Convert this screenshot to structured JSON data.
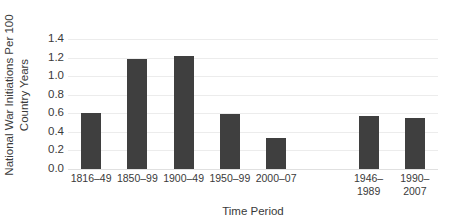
{
  "chart_data": {
    "type": "bar",
    "title": "",
    "xlabel": "Time Period",
    "ylabel": "National War Initiations Per 100 Country Years",
    "ylabel_line1": "National War Initiations Per 100",
    "ylabel_line2": "Country Years",
    "categories": [
      "1816–49",
      "1850–99",
      "1900–49",
      "1950–99",
      "2000–07",
      "",
      "1946–1989",
      "1990–2007"
    ],
    "values": [
      0.6,
      1.18,
      1.22,
      0.59,
      0.33,
      null,
      0.57,
      0.55
    ],
    "ylim": [
      0.0,
      1.4
    ],
    "ytick_labels": [
      "0.0",
      "0.2",
      "0.4",
      "0.6",
      "0.8",
      "1.0",
      "1.2",
      "1.4"
    ],
    "ytick_values": [
      0.0,
      0.2,
      0.4,
      0.6,
      0.8,
      1.0,
      1.2,
      1.4
    ],
    "grid": true,
    "legend": false,
    "bar_color": "#3f3f3f",
    "grid_color": "#ececec",
    "background_color": "#ffffff",
    "bars": [
      {
        "label_lines": [
          "1816–49"
        ],
        "value": 0.6,
        "slot": 0
      },
      {
        "label_lines": [
          "1850–99"
        ],
        "value": 1.18,
        "slot": 1
      },
      {
        "label_lines": [
          "1900–49"
        ],
        "value": 1.22,
        "slot": 2
      },
      {
        "label_lines": [
          "1950–99"
        ],
        "value": 0.59,
        "slot": 3
      },
      {
        "label_lines": [
          "2000–07"
        ],
        "value": 0.33,
        "slot": 4
      },
      {
        "label_lines": [
          "1946–",
          "1989"
        ],
        "value": 0.57,
        "slot": 6
      },
      {
        "label_lines": [
          "1990–",
          "2007"
        ],
        "value": 0.55,
        "slot": 7
      }
    ],
    "slot_count": 8
  }
}
